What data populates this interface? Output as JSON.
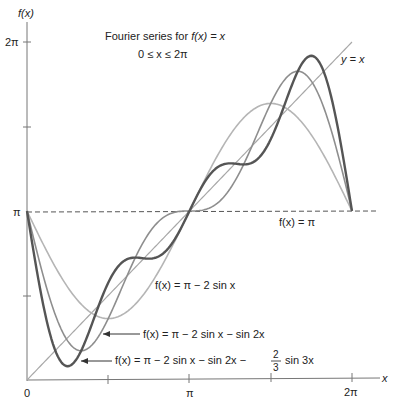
{
  "chart_data": {
    "type": "line",
    "title": "Fourier series for f(x) = x",
    "subtitle": "0 ≤ x ≤ 2π",
    "xlabel": "x",
    "ylabel": "f(x)",
    "xlim": [
      0,
      6.2832
    ],
    "ylim": [
      0,
      6.2832
    ],
    "grid": false,
    "legend": "inline annotations",
    "x_ticks": [
      {
        "value": 0,
        "label": "0"
      },
      {
        "value": 1.5708,
        "label": ""
      },
      {
        "value": 3.1416,
        "label": "π"
      },
      {
        "value": 4.7124,
        "label": ""
      },
      {
        "value": 6.2832,
        "label": "2π"
      }
    ],
    "y_ticks": [
      {
        "value": 1.5708,
        "label": ""
      },
      {
        "value": 3.1416,
        "label": "π"
      },
      {
        "value": 4.7124,
        "label": ""
      },
      {
        "value": 6.2832,
        "label": "2π"
      }
    ],
    "series": [
      {
        "name": "y = x",
        "expr": "x",
        "color": "#a8a8a8",
        "width": 1.2
      },
      {
        "name": "f(x) = π − 2 sin x",
        "expr": "pi - 2 sin x",
        "color": "#b5b5b5",
        "width": 1.6,
        "terms": [
          2,
          0,
          0
        ]
      },
      {
        "name": "f(x) = π − 2 sin x − sin 2x",
        "expr": "pi - 2 sin x - sin 2x",
        "color": "#8e8e8e",
        "width": 1.6,
        "terms": [
          2,
          1,
          0
        ]
      },
      {
        "name": "f(x) = π − 2 sin x − sin 2x − (2/3) sin 3x",
        "expr": "pi - 2 sin x - sin 2x - 2/3 sin 3x",
        "color": "#555555",
        "width": 2.4,
        "terms": [
          2,
          1,
          0.6667
        ]
      }
    ],
    "reference_line": {
      "name": "f(x) = π",
      "y": 3.1416,
      "style": "dashed",
      "color": "#555555"
    },
    "annotations": [
      {
        "text": "f(x) = π − 2 sin x",
        "points_to": "series 1"
      },
      {
        "text": "f(x) = π − 2 sin x − sin 2x",
        "points_to": "series 2",
        "arrow": true
      },
      {
        "text": "f(x) = π − 2 sin x − sin 2x − 2/3 sin 3x",
        "points_to": "series 3",
        "arrow": true
      },
      {
        "text": "y = x",
        "points_to": "series 0"
      },
      {
        "text": "f(x) = π",
        "points_to": "reference_line"
      }
    ]
  },
  "labels": {
    "y_axis": "f(x)",
    "x_axis": "x",
    "title_line1_prefix": "Fourier series for ",
    "title_line1_fx": "f(x) = x",
    "title_line2": "0 ≤ x ≤ 2π",
    "tick_x0": "0",
    "tick_xpi": "π",
    "tick_x2pi": "2π",
    "tick_ypi": "π",
    "tick_y2pi": "2π",
    "yx": "y = x",
    "fpi": "f(x) = π",
    "s1": "f(x) = π − 2 sin x",
    "s2": "f(x) = π − 2 sin x − sin 2x",
    "s3_main": "f(x) = π − 2 sin x − sin 2x −",
    "s3_frac_num": "2",
    "s3_frac_den": "3",
    "s3_tail": "sin 3x"
  }
}
